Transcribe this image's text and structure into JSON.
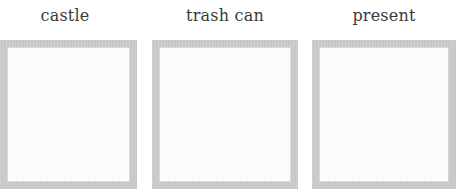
{
  "cards": [
    {
      "label": "castle"
    },
    {
      "label": "trash can"
    },
    {
      "label": "present"
    }
  ],
  "colors": {
    "border": "#cbcbcb",
    "label_text": "#3a3a3a",
    "background": "#ffffff"
  }
}
